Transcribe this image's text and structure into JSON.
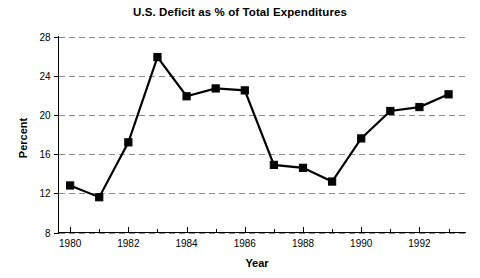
{
  "chart_data": {
    "type": "line",
    "title": "U.S. Deficit as % of Total Expenditures",
    "xlabel": "Year",
    "ylabel": "Percent",
    "x": [
      1980,
      1981,
      1982,
      1983,
      1984,
      1985,
      1986,
      1987,
      1988,
      1989,
      1990,
      1991,
      1992,
      1993
    ],
    "values": [
      12.8,
      11.6,
      17.2,
      25.9,
      21.9,
      22.7,
      22.5,
      14.9,
      14.6,
      13.2,
      17.6,
      20.4,
      20.8,
      22.1
    ],
    "series": [
      {
        "name": "U.S. Deficit as % of Total Expenditures",
        "values": [
          12.8,
          11.6,
          17.2,
          25.9,
          21.9,
          22.7,
          22.5,
          14.9,
          14.6,
          13.2,
          17.6,
          20.4,
          20.8,
          22.1
        ]
      }
    ],
    "xlim": [
      1979.6,
      1993.6
    ],
    "ylim": [
      8,
      28
    ],
    "ytick_labels": [
      "8",
      "12",
      "16",
      "20",
      "24",
      "28"
    ],
    "yticks": [
      8,
      12,
      16,
      20,
      24,
      28
    ],
    "xtick_labels": [
      "1980",
      "1982",
      "1984",
      "1986",
      "1988",
      "1990",
      "1992"
    ],
    "xticks_major": [
      1980,
      1982,
      1984,
      1986,
      1988,
      1990,
      1992
    ],
    "xticks_minor": [
      1981,
      1983,
      1985,
      1987,
      1989,
      1991,
      1993
    ],
    "grid": "horizontal-dashed",
    "legend": "none",
    "marker": "square",
    "line_color": "#000000",
    "grid_color": "#8a8a8a"
  }
}
